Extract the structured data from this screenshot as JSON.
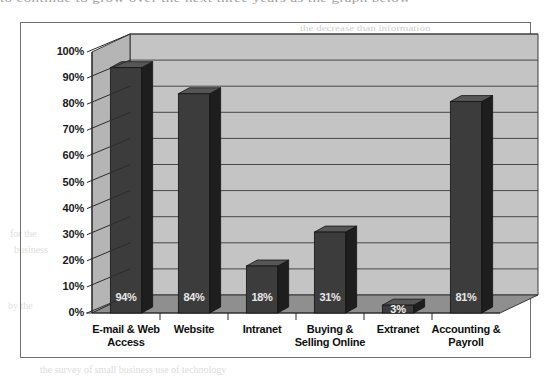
{
  "page": {
    "bleed_through": {
      "top_line": "to continue to grow over the next three years as the graph below",
      "right_1": "the decrease than information",
      "right_2": "in the next",
      "right_3": "and computer applications",
      "left_1": "for the",
      "left_2": "business",
      "left_3": "by the",
      "bottom_1": "the survey of small business use of technology"
    }
  },
  "chart_data": {
    "type": "bar",
    "style": "3d-column",
    "title": "",
    "subtitle": "",
    "xlabel": "",
    "ylabel": "",
    "categories": [
      "E-mail & Web Access",
      "Website",
      "Intranet",
      "Buying & Selling Online",
      "Extranet",
      "Accounting & Payroll"
    ],
    "category_lines": [
      [
        "E-mail & Web",
        "Access"
      ],
      [
        "Website",
        ""
      ],
      [
        "Intranet",
        ""
      ],
      [
        "Buying &",
        "Selling Online"
      ],
      [
        "Extranet",
        ""
      ],
      [
        "Accounting &",
        "Payroll"
      ]
    ],
    "values": [
      94,
      84,
      18,
      31,
      3,
      81
    ],
    "value_labels": [
      "94%",
      "84%",
      "18%",
      "31%",
      "3%",
      "81%"
    ],
    "ylim": [
      0,
      100
    ],
    "ytick_values": [
      100,
      90,
      80,
      70,
      60,
      50,
      40,
      30,
      20,
      10,
      0
    ],
    "ytick_labels": [
      "100%",
      "90%",
      "80%",
      "70%",
      "60%",
      "50%",
      "40%",
      "30%",
      "20%",
      "10%",
      "0%"
    ],
    "grid": true,
    "legend": "none",
    "colors": {
      "bar_front": "#3c3c3c",
      "bar_side": "#1e1e1e",
      "bar_top": "#565656",
      "wall_back": "#c4c4c4",
      "wall_left": "#b5b5b5",
      "floor": "#8f8f8f",
      "floor_front": "#a8a8a8",
      "gridline": "#3a3a3a",
      "axis": "#2b2b2b",
      "frame": "#6f6f6f",
      "label_text": "#101010",
      "value_text": "#e8e8e8"
    }
  }
}
